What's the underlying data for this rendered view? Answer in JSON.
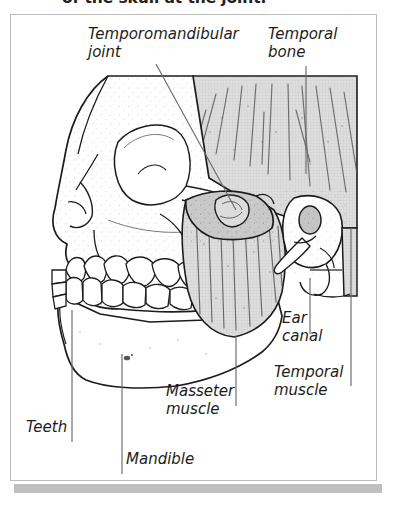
{
  "caption": {
    "text": "of the skull at the joint."
  },
  "figure": {
    "labels": [
      {
        "id": "temporomandibular-joint",
        "text": "Temporomandibular\njoint"
      },
      {
        "id": "temporal-bone",
        "text": "Temporal\nbone"
      },
      {
        "id": "ear-canal",
        "text": "Ear\ncanal"
      },
      {
        "id": "temporal-muscle",
        "text": "Temporal\nmuscle"
      },
      {
        "id": "masseter-muscle",
        "text": "Masseter\nmuscle"
      },
      {
        "id": "teeth",
        "text": "Teeth"
      },
      {
        "id": "mandible",
        "text": "Mandible"
      }
    ]
  },
  "colors": {
    "ink": "#1c1c1c",
    "frame": "#bdbdbd",
    "shadow": "#a9a9a9",
    "muscle_fill": "#d4d4d4",
    "bone_fill": "#ffffff",
    "leader": "#6b6b6b",
    "page": "#ffffff"
  }
}
